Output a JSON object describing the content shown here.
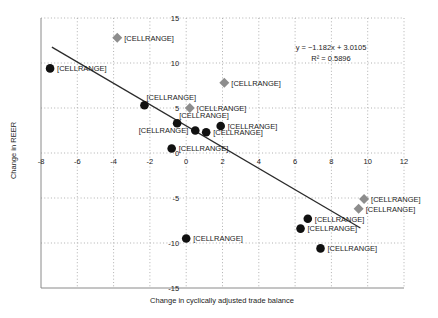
{
  "figure": {
    "y_axis_title": "Change in REER",
    "x_axis_title": "Change in cyclically adjusted trade balance",
    "equation_line1": "y = −1.182x + 3.0105",
    "equation_line2": "R² = 0.5896"
  },
  "chart_data": {
    "type": "scatter",
    "title": "",
    "xlabel": "Change in cyclically adjusted trade balance",
    "ylabel": "Change in REER",
    "xlim": [
      -8,
      12
    ],
    "ylim": [
      -15,
      15
    ],
    "x_ticks": [
      -8,
      -6,
      -4,
      -2,
      0,
      2,
      4,
      6,
      8,
      10,
      12
    ],
    "y_ticks": [
      15,
      10,
      5,
      0,
      -5,
      -10,
      -15
    ],
    "grid": "dotted",
    "legend": "none",
    "trendline": {
      "slope": -1.182,
      "intercept": 3.0105,
      "r_squared": 0.5896,
      "x_start": -7.4,
      "x_end": 9.6
    },
    "colors": {
      "circle_marker": "#111111",
      "diamond_marker": "#8d8d8d",
      "trendline": "#2b2b2b",
      "gridline": "#b0b0b0",
      "axis_line": "#8a8a8a",
      "text": "#1c1c1c"
    },
    "series": [
      {
        "name": "circle-series",
        "marker": "circle",
        "points": [
          {
            "x": -7.5,
            "y": 9.4,
            "label": "[CELLRANGE]",
            "label_pos": "right"
          },
          {
            "x": -2.3,
            "y": 5.3,
            "label": "[CELLRANGE]",
            "label_pos": "above-right"
          },
          {
            "x": -0.5,
            "y": 3.3,
            "label": "[CELLRANGE]",
            "label_pos": "above-right"
          },
          {
            "x": 0.5,
            "y": 2.5,
            "label": "[CELLRANGE]",
            "label_pos": "left"
          },
          {
            "x": 1.1,
            "y": 2.3,
            "label": "[CELLRANGE]",
            "label_pos": "right"
          },
          {
            "x": 1.9,
            "y": 3.0,
            "label": "[CELLRANGE]",
            "label_pos": "right"
          },
          {
            "x": -0.8,
            "y": 0.5,
            "label": "[CELLRANGE]",
            "label_pos": "right"
          },
          {
            "x": 0.0,
            "y": -9.5,
            "label": "[CELLRANGE]",
            "label_pos": "right"
          },
          {
            "x": 6.7,
            "y": -7.3,
            "label": "[CELLRANGE]",
            "label_pos": "right"
          },
          {
            "x": 6.3,
            "y": -8.4,
            "label": "[CELLRANGE]",
            "label_pos": "right"
          },
          {
            "x": 7.4,
            "y": -10.6,
            "label": "[CELLRANGE]",
            "label_pos": "right"
          }
        ]
      },
      {
        "name": "diamond-series",
        "marker": "diamond",
        "points": [
          {
            "x": -3.8,
            "y": 12.8,
            "label": "[CELLRANGE]",
            "label_pos": "right"
          },
          {
            "x": 0.2,
            "y": 5.0,
            "label": "[CELLRANGE]",
            "label_pos": "right"
          },
          {
            "x": 2.1,
            "y": 7.8,
            "label": "[CELLRANGE]",
            "label_pos": "right"
          },
          {
            "x": 9.8,
            "y": -5.1,
            "label": "[CELLRANGE]",
            "label_pos": "right"
          },
          {
            "x": 9.5,
            "y": -6.2,
            "label": "[CELLRANGE]",
            "label_pos": "right"
          }
        ]
      }
    ]
  }
}
